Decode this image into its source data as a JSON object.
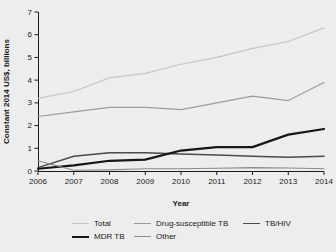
{
  "figure": {
    "background": "#ededed",
    "text_color": "#1a1a1a"
  },
  "chart_data": {
    "type": "line",
    "title": "",
    "xlabel": "Year",
    "ylabel": "Constant 2014 US$, billions",
    "x": [
      2006,
      2007,
      2008,
      2009,
      2010,
      2011,
      2012,
      2013,
      2014
    ],
    "ylim": [
      0,
      7
    ],
    "yticks": [
      0,
      1,
      2,
      3,
      4,
      5,
      6,
      7
    ],
    "grid": false,
    "legend_position": "bottom",
    "series": [
      {
        "name": "Total",
        "color": "#c5c5c5",
        "width": 1.2,
        "values": [
          3.2,
          3.5,
          4.1,
          4.3,
          4.7,
          5.0,
          5.4,
          5.7,
          6.3
        ]
      },
      {
        "name": "Drug-susceptible TB",
        "color": "#9b9b9b",
        "width": 1.2,
        "values": [
          2.4,
          2.6,
          2.8,
          2.8,
          2.7,
          3.0,
          3.3,
          3.1,
          3.9
        ]
      },
      {
        "name": "TB/HIV",
        "color": "#4a4a4a",
        "width": 1.5,
        "values": [
          0.15,
          0.65,
          0.8,
          0.8,
          0.75,
          0.7,
          0.65,
          0.6,
          0.65
        ]
      },
      {
        "name": "MDR TB",
        "color": "#161616",
        "width": 2.2,
        "values": [
          0.1,
          0.25,
          0.45,
          0.5,
          0.9,
          1.05,
          1.05,
          1.6,
          1.85
        ]
      },
      {
        "name": "Other",
        "color": "#8a8a8a",
        "width": 1.1,
        "values": [
          0.45,
          0.03,
          0.05,
          0.1,
          0.1,
          0.12,
          0.15,
          0.13,
          0.1
        ]
      }
    ]
  }
}
